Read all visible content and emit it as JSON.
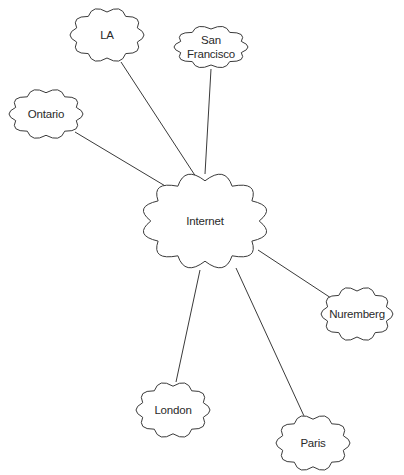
{
  "diagram": {
    "hub": {
      "id": "internet",
      "label": "Internet",
      "cx": 205,
      "cy": 221,
      "w": 126,
      "h": 98
    },
    "nodes": [
      {
        "id": "la",
        "label": "LA",
        "cx": 107,
        "cy": 35,
        "w": 74,
        "h": 56
      },
      {
        "id": "san-francisco",
        "label": "San\nFrancisco",
        "cx": 211,
        "cy": 47,
        "w": 74,
        "h": 44
      },
      {
        "id": "ontario",
        "label": "Ontario",
        "cx": 46,
        "cy": 114,
        "w": 74,
        "h": 52
      },
      {
        "id": "nuremberg",
        "label": "Nuremberg",
        "cx": 357,
        "cy": 314,
        "w": 72,
        "h": 56
      },
      {
        "id": "london",
        "label": "London",
        "cx": 173,
        "cy": 410,
        "w": 74,
        "h": 58
      },
      {
        "id": "paris",
        "label": "Paris",
        "cx": 313,
        "cy": 443,
        "w": 74,
        "h": 58
      }
    ],
    "edges": [
      {
        "from": "la",
        "to": "internet",
        "x1": 121,
        "y1": 62,
        "x2": 198,
        "y2": 180
      },
      {
        "from": "san-francisco",
        "to": "internet",
        "x1": 211,
        "y1": 69,
        "x2": 205,
        "y2": 174
      },
      {
        "from": "ontario",
        "to": "internet",
        "x1": 75,
        "y1": 132,
        "x2": 177,
        "y2": 193
      },
      {
        "from": "internet",
        "to": "nuremberg",
        "x1": 258,
        "y1": 250,
        "x2": 331,
        "y2": 298
      },
      {
        "from": "internet",
        "to": "london",
        "x1": 200,
        "y1": 270,
        "x2": 176,
        "y2": 382
      },
      {
        "from": "internet",
        "to": "paris",
        "x1": 236,
        "y1": 268,
        "x2": 304,
        "y2": 416
      }
    ]
  }
}
